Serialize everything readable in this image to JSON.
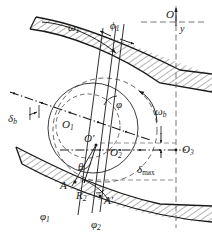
{
  "figure": {
    "width": 212,
    "height": 245,
    "background_color": "#ffffff",
    "line_color": "#1a1a1a",
    "hatch_color": "#1a1a1a",
    "dash_color": "#555555"
  },
  "labels": {
    "omega1": {
      "base": "ω",
      "sub": "1",
      "text": "ω1"
    },
    "phi1_top": {
      "base": "ϕ",
      "sub": "1",
      "text": "ϕ1"
    },
    "origin_O": {
      "text": "O"
    },
    "axis_y": {
      "text": "y"
    },
    "phi_center": {
      "text": "φ"
    },
    "omega_b": {
      "base": "ω",
      "sub": "b",
      "text": "ωb"
    },
    "delta_b": {
      "base": "δ",
      "sub": "b",
      "text": "δb"
    },
    "O1": {
      "base": "O",
      "sub": "1",
      "text": "O1"
    },
    "O_prime": {
      "text": "O′"
    },
    "O2": {
      "base": "O",
      "sub": "2",
      "text": "O2"
    },
    "O3": {
      "base": "O",
      "sub": "3",
      "text": "O3"
    },
    "theta": {
      "text": "θ"
    },
    "delta_max": {
      "base": "δ",
      "sub": "max",
      "text": "δmax"
    },
    "point_A": {
      "text": "A"
    },
    "R2": {
      "base": "R",
      "sub": "2",
      "text": "R2"
    },
    "point_A_prime": {
      "text": "A′"
    },
    "varphi1": {
      "base": "φ",
      "sub": "1",
      "text": "φ1"
    },
    "varphi2": {
      "base": "φ",
      "sub": "2",
      "text": "φ2"
    }
  },
  "elements": {
    "upper_band": "hatched-curved-band-upper",
    "lower_band": "hatched-curved-band-lower",
    "solid_circle": "thin-solid-circle",
    "dashed_circle_large": "dashed-circle-large",
    "dashed_circle_small": "dashed-circle-small",
    "chain_line_left": "dash-dot-chain-line",
    "chain_line_horizontal": "dash-dot-horizontal-line",
    "axis_vertical": "dashed-vertical-axis",
    "axis_horizontal": "dashed-horizontal-axis",
    "arrow_omega1": "curved-arrow-omega1",
    "arrow_omega_b": "curved-arrow-omega-b",
    "arrow_phi1": "double-arrow-phi1",
    "arrow_delta_max": "dimension-arrow-delta-max",
    "arrow_delta_b": "dimension-arrow-delta-b",
    "radial_lines": "radial-reference-lines"
  }
}
